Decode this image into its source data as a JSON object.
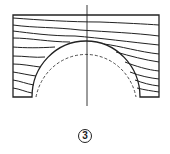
{
  "figure": {
    "label": "3"
  },
  "colors": {
    "line": "#222222",
    "background": "#ffffff"
  }
}
